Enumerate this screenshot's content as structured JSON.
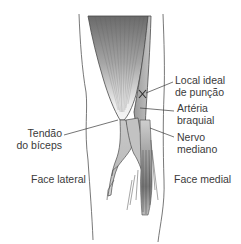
{
  "diagram": {
    "labels": {
      "puncture_site": [
        "Local ideal",
        "de punção"
      ],
      "brachial_artery": [
        "Artéria",
        "braquial"
      ],
      "median_nerve": [
        "Nervo",
        "mediano"
      ],
      "biceps_tendon": [
        "Tendão",
        "do bíceps"
      ],
      "lateral_face": "Face lateral",
      "medial_face": "Face medial"
    },
    "marker": {
      "symbol": "X",
      "meaning": "ideal puncture site"
    },
    "colors": {
      "muscle_dark": "#6e6e6e",
      "muscle_light": "#e6e6e6",
      "vessel": "#bdbdbd",
      "outline": "#4a4a4a",
      "text": "#3a3a3a"
    }
  }
}
